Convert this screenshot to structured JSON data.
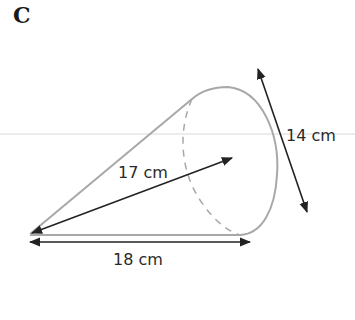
{
  "figure": {
    "label": "C",
    "shape": "cone",
    "colors": {
      "outline": "#a8a8a8",
      "arrow": "#222222",
      "guide": "#e6e6e6",
      "text": "#2a2a2a"
    },
    "dimensions": {
      "slant_height": "17 cm",
      "length": "18 cm",
      "diameter": "14 cm"
    }
  }
}
